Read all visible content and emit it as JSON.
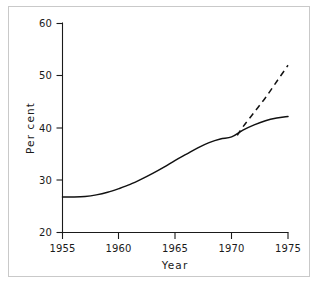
{
  "chart_data": {
    "type": "line",
    "title": "",
    "xlabel": "Year",
    "ylabel": "Per cent",
    "xlim": [
      1955,
      1975
    ],
    "ylim": [
      20,
      60
    ],
    "xticks": [
      1955,
      1960,
      1965,
      1970,
      1975
    ],
    "yticks": [
      20,
      30,
      40,
      50,
      60
    ],
    "xtick_labels": [
      "1955",
      "1960",
      "1965",
      "1970",
      "1975"
    ],
    "ytick_labels": [
      "20",
      "30",
      "40",
      "50",
      "60"
    ],
    "grid": false,
    "legend": false,
    "legend_position": "none",
    "line_color": "#111111",
    "axis_color": "#1a1a1a",
    "frame_color": "#c9c9c9",
    "background_color": "#ffffff",
    "series": [
      {
        "name": "observed-and-projected-low",
        "style": "solid",
        "x": [
          1955,
          1956,
          1957,
          1958,
          1959,
          1960,
          1961,
          1962,
          1963,
          1964,
          1965,
          1966,
          1967,
          1968,
          1969,
          1970,
          1971,
          1972,
          1973,
          1974,
          1975
        ],
        "values": [
          26.8,
          26.8,
          26.9,
          27.2,
          27.7,
          28.4,
          29.2,
          30.2,
          31.3,
          32.5,
          33.8,
          35.0,
          36.2,
          37.2,
          37.9,
          38.3,
          39.6,
          40.6,
          41.4,
          41.9,
          42.2
        ]
      },
      {
        "name": "projection-high",
        "style": "dashed",
        "x": [
          1970.5,
          1971,
          1972,
          1973,
          1974,
          1975
        ],
        "values": [
          38.6,
          40.2,
          43.0,
          45.8,
          48.9,
          52.0
        ]
      }
    ]
  },
  "axis_labels": {
    "y_title": "Per cent",
    "x_title": "Year"
  }
}
